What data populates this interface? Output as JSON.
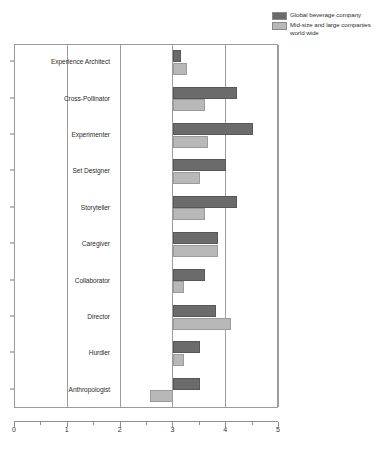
{
  "chart_data": {
    "type": "bar",
    "orientation": "horizontal",
    "title": "",
    "xlabel": "",
    "ylabel": "",
    "xlim": [
      0,
      5
    ],
    "xticks": [
      0,
      1,
      2,
      3,
      4,
      5
    ],
    "xtick_labels": [
      "0",
      "1",
      "2",
      "3",
      "4",
      "5"
    ],
    "minor_xticks": [
      0.5,
      1.5,
      2.5,
      3.5,
      4.5
    ],
    "grid": true,
    "grid_axis": "x",
    "legend_position": "top-right",
    "bar_baseline": 3.0,
    "categories": [
      "Experience Architect",
      "Cross-Pollinator",
      "Experimenter",
      "Set Designer",
      "Storyteller",
      "Caregiver",
      "Collaborator",
      "Director",
      "Hurdler",
      "Anthropologist"
    ],
    "series": [
      {
        "name": "Global beverage company",
        "color": "#6b6b6b",
        "values": [
          3.15,
          4.2,
          4.5,
          4.0,
          4.2,
          3.85,
          3.6,
          3.8,
          3.5,
          3.5
        ]
      },
      {
        "name": "Mid-size and large companies world wide",
        "color": "#b8b8b8",
        "values": [
          3.25,
          3.6,
          3.65,
          3.5,
          3.6,
          3.85,
          3.2,
          4.1,
          3.2,
          2.55
        ]
      }
    ]
  },
  "legend": {
    "entries": [
      {
        "label": "Global beverage company",
        "color": "#6b6b6b"
      },
      {
        "label": "Mid-size and large companies",
        "label2": "world wide",
        "color": "#b8b8b8"
      }
    ]
  }
}
